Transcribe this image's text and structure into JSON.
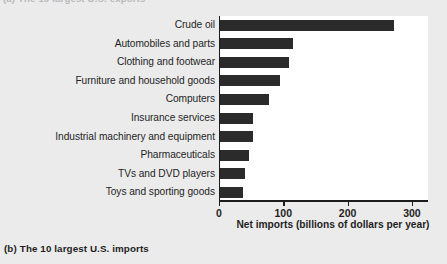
{
  "page": {
    "background_color": "#ebebeb",
    "plot_background_color": "#ffffff",
    "bar_color": "#2b2b2b",
    "axis_color": "#1c1c1c",
    "cut_off_header_text": "(a) The 10 largest U.S. exports"
  },
  "caption": {
    "label": "(b)",
    "text": "The 10 largest U.S. imports"
  },
  "chart_data": {
    "type": "bar",
    "orientation": "horizontal",
    "title": "",
    "xlabel": "Net imports (billions of dollars per year)",
    "ylabel": "",
    "xlim": [
      0,
      325
    ],
    "xticks": [
      0,
      100,
      200,
      300
    ],
    "xtick_labels": [
      "0",
      "100",
      "200",
      "300"
    ],
    "grid": false,
    "legend": false,
    "units": "billions of dollars per year",
    "categories": [
      "Crude oil",
      "Automobiles and parts",
      "Clothing and footwear",
      "Furniture and household goods",
      "Computers",
      "Insurance services",
      "Industrial machinery and equipment",
      "Pharmaceuticals",
      "TVs and DVD players",
      "Toys and sporting goods"
    ],
    "values": [
      270,
      113,
      107,
      94,
      76,
      51,
      51,
      45,
      39,
      35
    ]
  }
}
